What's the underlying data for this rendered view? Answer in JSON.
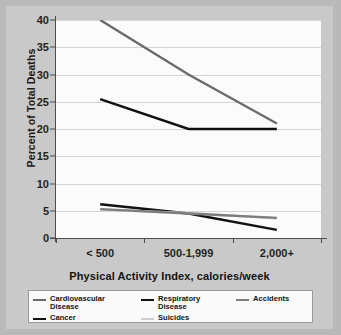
{
  "chart_data": {
    "type": "line",
    "title": "",
    "xlabel": "Physical Activity Index, calories/week",
    "ylabel": "Percent of Total Deaths",
    "categories": [
      "< 500",
      "500-1,999",
      "2,000+"
    ],
    "ylim": [
      0,
      40
    ],
    "yticks": [
      0,
      5,
      10,
      15,
      20,
      25,
      30,
      35,
      40
    ],
    "ytick_labels": [
      "0",
      "5",
      "10",
      "15",
      "20",
      "25",
      "30",
      "35",
      "40"
    ],
    "grid": "horizontal",
    "legend_position": "bottom",
    "series": [
      {
        "name": "Cardiovascular\nDisease",
        "color": "#6b6b6b",
        "values": [
          40.0,
          30.0,
          21.0
        ]
      },
      {
        "name": "Cancer",
        "color": "#111111",
        "values": [
          25.5,
          20.0,
          20.0
        ]
      },
      {
        "name": "Respiratory\nDisease",
        "color": "#111111",
        "values": [
          6.2,
          4.5,
          1.5
        ]
      },
      {
        "name": "Suicides",
        "color": "#cfcfcf",
        "values": [
          5.2,
          4.6,
          3.6
        ]
      },
      {
        "name": "Accidents",
        "color": "#7d7d7d",
        "values": [
          5.3,
          4.5,
          3.7
        ]
      }
    ]
  },
  "legend": {
    "columns": [
      [
        {
          "label": "Cardiovascular\nDisease",
          "color": "#6b6b6b"
        },
        {
          "label": "Cancer",
          "color": "#111111"
        }
      ],
      [
        {
          "label": "Respiratory\nDisease",
          "color": "#111111"
        },
        {
          "label": "Suicides",
          "color": "#cfcfcf"
        }
      ],
      [
        {
          "label": "Accidents",
          "color": "#7d7d7d"
        }
      ]
    ]
  }
}
